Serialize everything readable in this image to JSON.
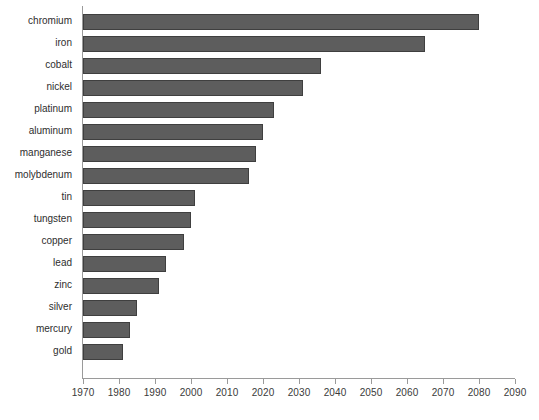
{
  "chart_data": {
    "type": "bar",
    "orientation": "horizontal",
    "title": "",
    "subtitle": "",
    "xlabel": "",
    "ylabel": "",
    "xlim": [
      1970,
      2090
    ],
    "xticks": [
      1970,
      1980,
      1990,
      2000,
      2010,
      2020,
      2030,
      2040,
      2050,
      2060,
      2070,
      2080,
      2090
    ],
    "grid": false,
    "legend": null,
    "bar_color": "#5d5d5d",
    "bar_edge_color": "#3f3f3f",
    "axis_color": "#9a9a9a",
    "baseline": 1970,
    "categories": [
      "chromium",
      "iron",
      "cobalt",
      "nickel",
      "platinum",
      "aluminum",
      "manganese",
      "molybdenum",
      "tin",
      "tungsten",
      "copper",
      "lead",
      "zinc",
      "silver",
      "mercury",
      "gold"
    ],
    "values": [
      2080,
      2065,
      2036,
      2031,
      2023,
      2020,
      2018,
      2016,
      2001,
      2000,
      1998,
      1993,
      1991,
      1985,
      1983,
      1981
    ]
  }
}
